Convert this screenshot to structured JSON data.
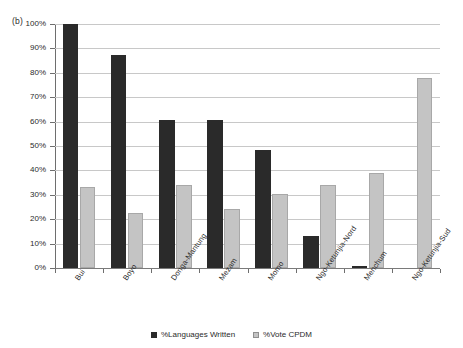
{
  "panel": {
    "label": "(b)"
  },
  "chart_data": {
    "type": "bar",
    "title": "",
    "subtitle": "",
    "xlabel": "",
    "ylabel": "",
    "ylim": [
      0,
      100
    ],
    "ytick_step": 10,
    "grid": true,
    "legend_position": "bottom-center",
    "value_suffix": "%",
    "categories": [
      "Bui",
      "Boyo",
      "Donga-Mantung",
      "Mezam",
      "Momo",
      "Ngo-Ketunjia-Nord",
      "Menchum",
      "Ngo-Ketunjia-Sud"
    ],
    "ytick_labels": [
      "100%",
      "90%",
      "80%",
      "70%",
      "60%",
      "50%",
      "40%",
      "30%",
      "20%",
      "10%",
      "0%"
    ],
    "ytick_values": [
      100,
      90,
      80,
      70,
      60,
      50,
      40,
      30,
      20,
      10,
      0
    ],
    "series": [
      {
        "name": "%Languages Written",
        "color": "#2a2a2a",
        "values": [
          100,
          87.5,
          60.5,
          60.5,
          48.5,
          13,
          1,
          0
        ]
      },
      {
        "name": "%Vote CPDM",
        "color": "#c4c4c4",
        "values": [
          33,
          22.5,
          34,
          24,
          30.5,
          34,
          39,
          78
        ]
      }
    ],
    "annotations": []
  }
}
